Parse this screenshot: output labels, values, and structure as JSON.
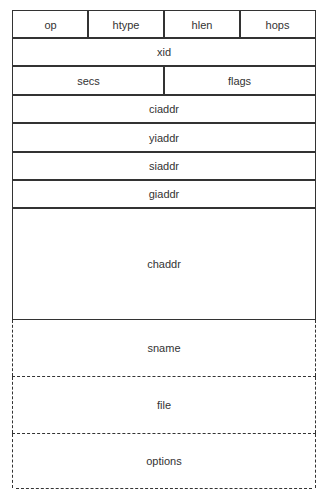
{
  "diagram": {
    "title": "",
    "type": "packet-format",
    "rows": [
      {
        "fields": [
          "op",
          "htype",
          "hlen",
          "hops"
        ]
      },
      {
        "fields": [
          "xid"
        ]
      },
      {
        "fields": [
          "secs",
          "flags"
        ]
      },
      {
        "fields": [
          "ciaddr"
        ]
      },
      {
        "fields": [
          "yiaddr"
        ]
      },
      {
        "fields": [
          "siaddr"
        ]
      },
      {
        "fields": [
          "giaddr"
        ]
      },
      {
        "fields": [
          "chaddr"
        ]
      },
      {
        "fields": [
          "sname"
        ],
        "style": "dashed"
      },
      {
        "fields": [
          "file"
        ],
        "style": "dashed"
      },
      {
        "fields": [
          "options"
        ],
        "style": "dashed"
      }
    ]
  },
  "labels": {
    "op": "op",
    "htype": "htype",
    "hlen": "hlen",
    "hops": "hops",
    "xid": "xid",
    "secs": "secs",
    "flags": "flags",
    "ciaddr": "ciaddr",
    "yiaddr": "yiaddr",
    "siaddr": "siaddr",
    "giaddr": "giaddr",
    "chaddr": "chaddr",
    "sname": "sname",
    "file": "file",
    "options": "options"
  }
}
